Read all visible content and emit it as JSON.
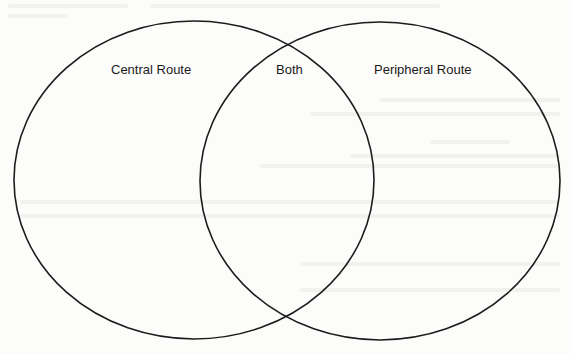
{
  "diagram": {
    "type": "venn",
    "sets": [
      {
        "id": "left",
        "label": "Central Route",
        "cx": 194,
        "cy": 180,
        "rx": 180,
        "ry": 159
      },
      {
        "id": "right",
        "label": "Peripheral Route",
        "cx": 380,
        "cy": 181,
        "rx": 180,
        "ry": 159
      }
    ],
    "intersection_label": "Both",
    "stroke_color": "#1c1c1c",
    "background_color": "#fcfcfb"
  }
}
